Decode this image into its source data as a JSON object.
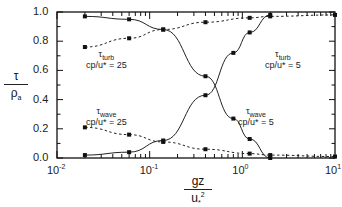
{
  "chart_data": {
    "type": "line",
    "title": "",
    "xlabel": "gz / u*^2",
    "ylabel": "τ / ρa",
    "xscale": "log",
    "xlim": [
      0.01,
      10
    ],
    "ylim": [
      0.0,
      1.0
    ],
    "x_ticks": [
      "10-2",
      "10-1",
      "100",
      "101"
    ],
    "y_ticks": [
      "0.0",
      "0.2",
      "0.4",
      "0.6",
      "0.8",
      "1.0"
    ],
    "grid": false,
    "legend": "inline annotations",
    "x": [
      0.02,
      0.06,
      0.14,
      0.4,
      0.8,
      1.2,
      2.0
    ],
    "series": [
      {
        "name": "τwave cp/u* = 5",
        "style": "solid",
        "x": [
          0.02,
          0.06,
          0.14,
          0.4,
          0.8,
          1.2,
          2.0
        ],
        "values": [
          0.97,
          0.95,
          0.88,
          0.56,
          0.27,
          0.13,
          0.0
        ]
      },
      {
        "name": "τturb cp/u* = 5",
        "style": "solid",
        "x": [
          0.02,
          0.06,
          0.14,
          0.4,
          0.8,
          1.2,
          2.0
        ],
        "values": [
          0.02,
          0.04,
          0.12,
          0.43,
          0.72,
          0.86,
          0.98
        ]
      },
      {
        "name": "τturb cp/u* = 25",
        "style": "dashed",
        "x": [
          0.02,
          0.06,
          0.14,
          0.4,
          1.2,
          2.0,
          10
        ],
        "values": [
          0.76,
          0.82,
          0.88,
          0.93,
          0.96,
          0.97,
          0.98
        ]
      },
      {
        "name": "τwave cp/u* = 25",
        "style": "dashed",
        "x": [
          0.02,
          0.06,
          0.14,
          0.4,
          1.2,
          2.0,
          10
        ],
        "values": [
          0.21,
          0.16,
          0.11,
          0.06,
          0.03,
          0.02,
          0.01
        ]
      }
    ],
    "annotations": [
      {
        "text": "τturb",
        "sub": "cp/u* = 25",
        "near": "upper dashed curve, left"
      },
      {
        "text": "τturb",
        "sub": "cp/u* = 5",
        "near": "rising solid curve, right"
      },
      {
        "text": "τwave",
        "sub": "cp/u* = 25",
        "near": "lower dashed curve, left"
      },
      {
        "text": "τwave",
        "sub": "cp/u* = 5",
        "near": "falling solid curve, right"
      }
    ]
  },
  "labels": {
    "ylabel_num": "τ",
    "ylabel_den": "ρa",
    "xlabel_num": "gz",
    "xlabel_den": "u*2",
    "ann_turb25_main": "τ",
    "ann_turb25_sub": "turb",
    "ann_turb25_param": "cp/u* = 25",
    "ann_turb5_main": "τ",
    "ann_turb5_sub": "turb",
    "ann_turb5_param": "cp/u* = 5",
    "ann_wave25_main": "τ",
    "ann_wave25_sub": "wave",
    "ann_wave25_param": "cp/u* = 25",
    "ann_wave5_main": "τ",
    "ann_wave5_sub": "wave",
    "ann_wave5_param": "cp/u* = 5"
  }
}
